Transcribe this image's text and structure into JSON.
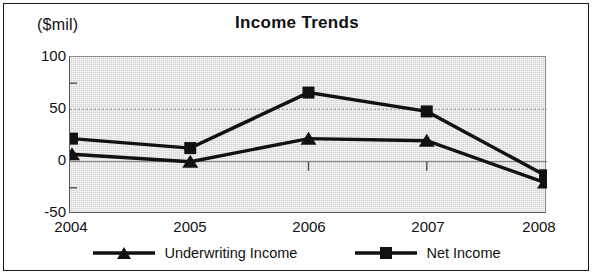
{
  "chart_data": {
    "type": "line",
    "title": "Income Trends",
    "xlabel": "",
    "ylabel": "($mil)",
    "categories": [
      "2004",
      "2005",
      "2006",
      "2007",
      "2008"
    ],
    "ylim": [
      -50,
      100
    ],
    "yticks": [
      100,
      50,
      0,
      -50
    ],
    "ytick_labels": [
      "100",
      "50",
      "0",
      "-50"
    ],
    "minor_yticks": [
      75,
      25,
      -25
    ],
    "grid": true,
    "legend_position": "bottom",
    "series": [
      {
        "name": "Underwriting Income",
        "marker": "triangle",
        "color": "#111111",
        "values": [
          7,
          0,
          22,
          20,
          -20
        ]
      },
      {
        "name": "Net Income",
        "marker": "square",
        "color": "#111111",
        "values": [
          22,
          13,
          66,
          48,
          -13
        ]
      }
    ]
  },
  "chart": {
    "title": "Income Trends",
    "unit_label": "($mil)",
    "ytick_labels": [
      "100",
      "50",
      "0",
      "-50"
    ],
    "xtick_labels": [
      "2004",
      "2005",
      "2006",
      "2007",
      "2008"
    ]
  },
  "legend": {
    "items": [
      {
        "label": "Underwriting Income",
        "marker": "triangle-marker-icon"
      },
      {
        "label": "Net Income",
        "marker": "square-marker-icon"
      }
    ]
  },
  "colors": {
    "series": "#111111",
    "plot_background": "#d2d2d2",
    "frame": "#1a1a1a",
    "gridline": "#9a9a9a"
  }
}
